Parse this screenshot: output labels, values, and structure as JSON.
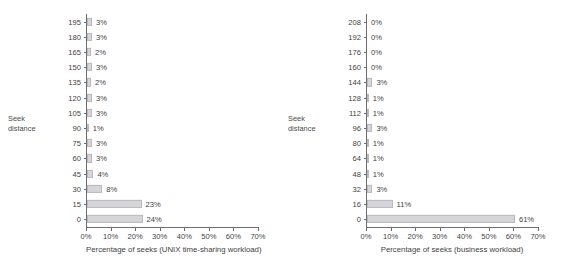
{
  "chart_data": [
    {
      "type": "bar",
      "orientation": "horizontal",
      "title": "",
      "xlabel": "Percentage of seeks (UNIX time-sharing workload)",
      "ylabel": "Seek distance",
      "ylabel_lines": [
        "Seek",
        "distance"
      ],
      "xlim": [
        0,
        70
      ],
      "xticks": [
        0,
        10,
        20,
        30,
        40,
        50,
        60,
        70
      ],
      "xtick_labels": [
        "0%",
        "10%",
        "20%",
        "30%",
        "40%",
        "50%",
        "60%",
        "70%"
      ],
      "grid": false,
      "legend": false,
      "categories": [
        "195",
        "180",
        "165",
        "150",
        "135",
        "120",
        "105",
        "90",
        "75",
        "60",
        "45",
        "30",
        "15",
        "0"
      ],
      "values": [
        3,
        3,
        2,
        3,
        2,
        3,
        3,
        1,
        3,
        3,
        4,
        8,
        23,
        24
      ],
      "value_labels": [
        "3%",
        "3%",
        "2%",
        "3%",
        "2%",
        "3%",
        "3%",
        "1%",
        "3%",
        "3%",
        "4%",
        "8%",
        "23%",
        "24%"
      ],
      "bar_draw_widths": [
        2.0,
        2.0,
        1.6,
        2.0,
        1.6,
        2.0,
        2.0,
        0.7,
        2.0,
        2.0,
        2.6,
        6.2,
        22.2,
        22.6
      ]
    },
    {
      "type": "bar",
      "orientation": "horizontal",
      "title": "",
      "xlabel": "Percentage of seeks (business workload)",
      "ylabel": "Seek distance",
      "ylabel_lines": [
        "Seek",
        "distance"
      ],
      "xlim": [
        0,
        70
      ],
      "xticks": [
        0,
        10,
        20,
        30,
        40,
        50,
        60,
        70
      ],
      "xtick_labels": [
        "0%",
        "10%",
        "20%",
        "30%",
        "40%",
        "50%",
        "60%",
        "70%"
      ],
      "grid": false,
      "legend": false,
      "categories": [
        "208",
        "192",
        "176",
        "160",
        "144",
        "128",
        "112",
        "96",
        "80",
        "64",
        "48",
        "32",
        "16",
        "0"
      ],
      "values": [
        0,
        0,
        0,
        0,
        3,
        1,
        1,
        3,
        1,
        1,
        1,
        3,
        11,
        61
      ],
      "value_labels": [
        "0%",
        "0%",
        "0%",
        "0%",
        "3%",
        "1%",
        "1%",
        "3%",
        "1%",
        "1%",
        "1%",
        "3%",
        "11%",
        "61%"
      ],
      "bar_draw_widths": [
        0,
        0,
        0,
        0,
        2.2,
        0.7,
        0.7,
        2.2,
        0.7,
        0.7,
        0.7,
        2.2,
        10.4,
        60.2
      ]
    }
  ],
  "colors": {
    "bar_fill": "#d6d6da",
    "bar_stroke": "#b9b9bf",
    "axis": "#6e6e6e",
    "text": "#3f3f3f",
    "background": "#ffffff"
  }
}
